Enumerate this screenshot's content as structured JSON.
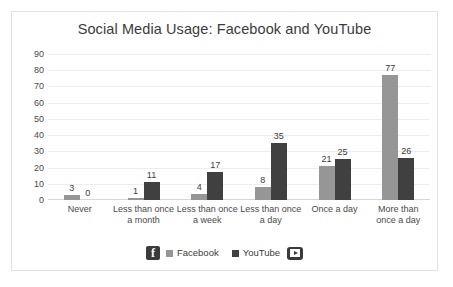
{
  "chart_data": {
    "type": "bar",
    "title": "Social Media Usage: Facebook and YouTube",
    "xlabel": "",
    "ylabel": "",
    "ylim": [
      0,
      90
    ],
    "y_ticks": [
      90,
      80,
      70,
      60,
      50,
      40,
      30,
      20,
      10,
      0
    ],
    "grid": true,
    "legend_position": "bottom",
    "categories": [
      "Never",
      "Less than once a month",
      "Less than once a week",
      "Less than once a day",
      "Once a day",
      "More than once a day"
    ],
    "category_lines": [
      [
        "Never",
        ""
      ],
      [
        "Less than once",
        "a month"
      ],
      [
        "Less than once",
        "a week"
      ],
      [
        "Less than once",
        "a day"
      ],
      [
        "Once a day",
        ""
      ],
      [
        "More than",
        "once a day"
      ]
    ],
    "series": [
      {
        "name": "Facebook",
        "color": "#969696",
        "values": [
          3,
          1,
          4,
          8,
          21,
          77
        ]
      },
      {
        "name": "YouTube",
        "color": "#404040",
        "values": [
          0,
          11,
          17,
          35,
          25,
          26
        ]
      }
    ]
  },
  "legend": {
    "facebook_label": "Facebook",
    "youtube_label": "YouTube",
    "facebook_logo_glyph": "f"
  },
  "icons": {
    "facebook": "facebook-logo-icon",
    "youtube": "youtube-logo-icon"
  },
  "colors": {
    "facebook_bar": "#969696",
    "youtube_bar": "#404040",
    "gridline": "#ededed",
    "border": "#e2e2e2",
    "text": "#3b3b3b"
  }
}
